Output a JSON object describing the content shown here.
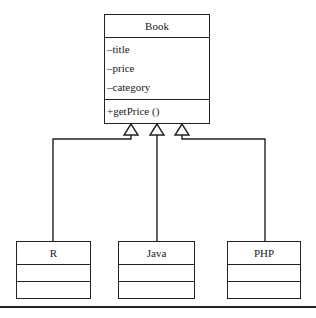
{
  "diagram": {
    "type": "UML class diagram (generalization)",
    "parent": {
      "name": "Book",
      "attributes": [
        "–title",
        "–price",
        "–category"
      ],
      "methods": [
        "+getPrice ()"
      ]
    },
    "children": [
      {
        "name": "R"
      },
      {
        "name": "Java"
      },
      {
        "name": "PHP"
      }
    ],
    "relationship": "inheritance",
    "colors": {
      "line": "#222222",
      "background": "#ffffff"
    }
  }
}
